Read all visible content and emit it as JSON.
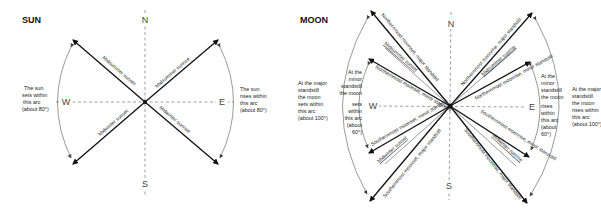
{
  "sun": {
    "title": "SUN",
    "compass": {
      "north": "N",
      "south": "S",
      "east": "E",
      "west": "W"
    },
    "rays": [
      {
        "label": "Midsummer sunset",
        "direction": "northwest"
      },
      {
        "label": "Midsummer sunrise",
        "direction": "northeast"
      },
      {
        "label": "Midwinter sunset",
        "direction": "southwest"
      },
      {
        "label": "Midwinter sunrise",
        "direction": "southeast"
      }
    ],
    "west_note": [
      "The sun",
      "sets within",
      "this arc",
      "(about 80°)"
    ],
    "east_note": [
      "The sun",
      "rises within",
      "this arc",
      "(about 80°)"
    ]
  },
  "moon": {
    "title": "MOON",
    "compass": {
      "north": "N",
      "south": "S",
      "east": "E",
      "west": "W"
    },
    "rays": [
      {
        "label": "Northernmost moonset, major standstill",
        "direction": "northwest-outer",
        "weight": "bold"
      },
      {
        "label": "Midsummer sunset",
        "direction": "northwest-mid",
        "weight": "thin"
      },
      {
        "label": "Northernmost moonset, minor standstill",
        "direction": "northwest-inner",
        "weight": "bold"
      },
      {
        "label": "Northernmost moonrise, major standstill",
        "direction": "northeast-outer",
        "weight": "bold"
      },
      {
        "label": "Midsummer sunrise",
        "direction": "northeast-mid",
        "weight": "thin"
      },
      {
        "label": "Northernmost moonrise, minor standstill",
        "direction": "northeast-inner",
        "weight": "bold"
      },
      {
        "label": "Southernmost moonset, minor standstill",
        "direction": "southwest-inner",
        "weight": "bold"
      },
      {
        "label": "Midwinter sunset",
        "direction": "southwest-mid",
        "weight": "thin"
      },
      {
        "label": "Southernmost moonset, major standstill",
        "direction": "southwest-outer",
        "weight": "bold"
      },
      {
        "label": "Southernmost moonrise, minor standstill",
        "direction": "southeast-inner",
        "weight": "bold"
      },
      {
        "label": "Midwinter sunrise",
        "direction": "southeast-mid",
        "weight": "thin"
      },
      {
        "label": "Southernmost moonrise, major standstill",
        "direction": "southeast-outer",
        "weight": "bold"
      }
    ],
    "west_outer_note": [
      "At the major",
      "standstill",
      "the moon",
      "sets within",
      "this arc",
      "(about 100°)"
    ],
    "west_inner_note": [
      "At the",
      "minor",
      "standstill",
      "the moon",
      "sets",
      "within",
      "this arc",
      "(about",
      "60°)"
    ],
    "east_inner_note": [
      "At the",
      "minor",
      "standstill",
      "the moon",
      "rises",
      "within",
      "this arc",
      "(about",
      "60°)"
    ],
    "east_outer_note": [
      "At the major",
      "standstill",
      "the moon",
      "rises within",
      "this arc",
      "(about 100°)"
    ]
  }
}
